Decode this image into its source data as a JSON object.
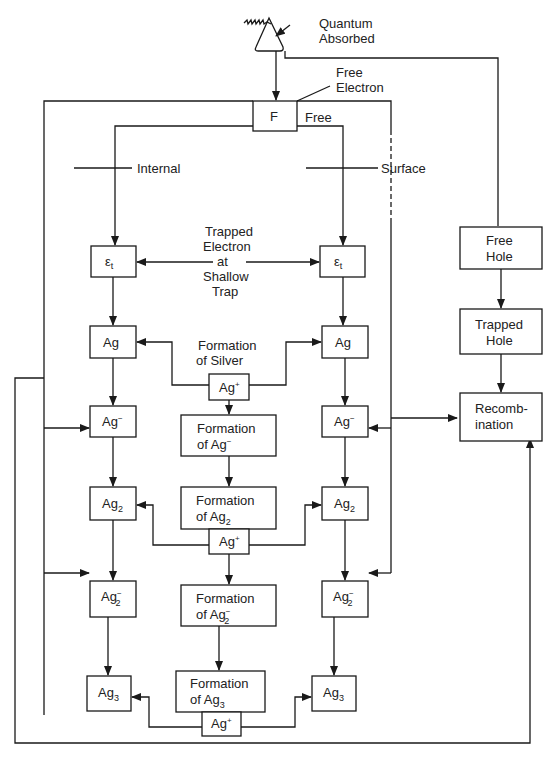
{
  "labels": {
    "quantum": [
      "Quantum",
      "Absorbed"
    ],
    "free_electron": [
      "Free",
      "Electron"
    ],
    "f_box": "F",
    "free": "Free",
    "internal": "Internal",
    "surface": "Surface",
    "trapped": [
      "Trapped",
      "Electron",
      "at",
      "Shallow",
      "Trap"
    ],
    "formation_silver": [
      "Formation",
      "of Silver"
    ],
    "free_hole": [
      "Free",
      "Hole"
    ],
    "trapped_hole": [
      "Trapped",
      "Hole"
    ],
    "recomb": [
      "Recomb-",
      "ination"
    ],
    "eps": "ε",
    "eps_sub": "t",
    "ag": "Ag",
    "ag_plus_sup": "+",
    "ag_minus_sup": "−",
    "sub2": "2",
    "sub3": "3",
    "formation": "Formation",
    "of_ag": "of Ag"
  },
  "colors": {
    "stroke": "#1a1a1a",
    "text": "#222222",
    "background": "#ffffff"
  }
}
